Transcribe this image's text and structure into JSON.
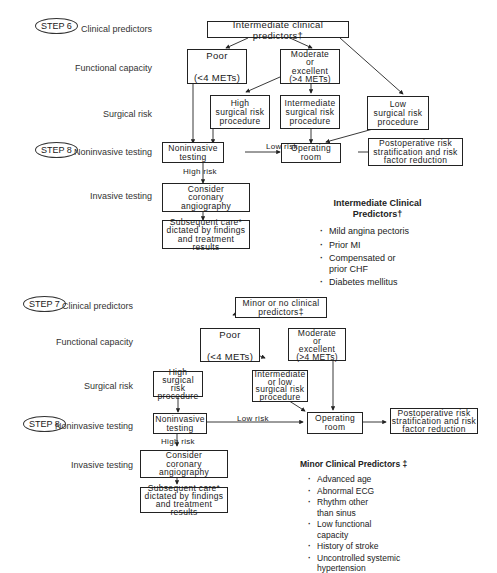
{
  "top_section": {
    "steps": [
      {
        "label": "STEP 6",
        "row": "clinical"
      },
      {
        "label": "STEP 8",
        "row": "noninvasive"
      }
    ],
    "row_labels": {
      "clinical": "Clinical predictors",
      "functional": "Functional capacity",
      "surgical": "Surgical risk",
      "noninvasive": "Noninvasive testing",
      "invasive": "Invasive testing"
    },
    "boxes": {
      "predictors": "Intermediate clinical predictors†",
      "poor": "Poor\n\n(<4 METs)",
      "moderate": "Moderate\nor\nexcellent\n(>4 METs)",
      "high_risk": "High\nsurgical risk\nprocedure",
      "intermediate_risk": "Intermediate\nsurgical risk\nprocedure",
      "low_risk": "Low\nsurgical risk\nprocedure",
      "noninvasive": "Noninvasive\ntesting",
      "operating_room": "Operating\nroom",
      "postoperative": "Postoperative risk\nstratification and risk\nfactor reduction",
      "angiography": "Consider\ncoronary\nangiography",
      "subsequent_care": "Subsequent care*\ndictated by findings\nand treatment results"
    },
    "edge_labels": {
      "low_risk": "Low risk",
      "high_risk": "High  risk"
    },
    "legend": {
      "title": "Intermediate Clinical\nPredictors†",
      "items": [
        "Mild angina pectoris",
        "Prior MI",
        "Compensated or\nprior CHF",
        "Diabetes mellitus"
      ]
    }
  },
  "bottom_section": {
    "steps": [
      {
        "label": "STEP 7",
        "row": "clinical"
      },
      {
        "label": "STEP 8",
        "row": "noninvasive"
      }
    ],
    "row_labels": {
      "clinical": "Clinical predictors",
      "functional": "Functional capacity",
      "surgical": "Surgical risk",
      "noninvasive": "Noninvasive testing",
      "invasive": "Invasive testing"
    },
    "boxes": {
      "predictors": "Minor or no clinical\npredictors‡",
      "poor": "Poor\n\n(<4 METs)",
      "moderate": "Moderate\nor\nexcellent\n(>4 METs)",
      "high_risk": "High surgical\nrisk\nprocedure",
      "intermediate_low_risk": "Intermediate\nor low\nsurgical risk\nprocedure",
      "noninvasive": "Noninvasive\ntesting",
      "operating_room": "Operating\nroom",
      "postoperative": "Postoperative risk\nstratification and risk\nfactor reduction",
      "angiography": "Consider\ncoronary\nangiography",
      "subsequent_care": "Subsequent care*\ndictated by findings\nand treatment results"
    },
    "edge_labels": {
      "low_risk": "Low risk",
      "high_risk": "High  risk"
    },
    "legend": {
      "title": "Minor Clinical Predictors ‡",
      "items": [
        "Advanced age",
        "Abnormal ECG",
        "Rhythm other\nthan sinus",
        "Low functional\ncapacity",
        "History of stroke",
        "Uncontrolled systemic\nhypertension"
      ]
    }
  }
}
